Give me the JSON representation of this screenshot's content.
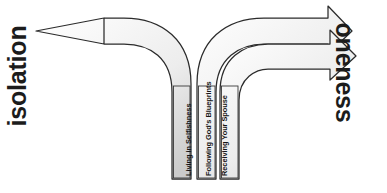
{
  "diagram": {
    "left_axis_label": "isolation",
    "right_axis_label": "oneness",
    "paths": [
      {
        "id": "living-in-selfishness",
        "label": "Living in Selfishness",
        "direction": "left",
        "destination": "isolation",
        "arrowheads": 1
      },
      {
        "id": "following-gods-blueprints",
        "label": "Following God's Blueprints",
        "direction": "right",
        "destination": "oneness",
        "arrowheads": 1
      },
      {
        "id": "receiving-your-spouse",
        "label": "Receiving Your Spouse",
        "direction": "right",
        "destination": "oneness",
        "arrowheads": 1
      }
    ],
    "colors": {
      "outline": "#2b2b2b",
      "fill_light": "#fcfcfc",
      "fill_dark": "#d2d2d2",
      "text": "#1c1c1c",
      "background": "#ffffff"
    }
  }
}
